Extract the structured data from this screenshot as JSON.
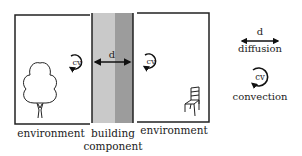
{
  "diagram": {
    "left_environment": {
      "label": "environment",
      "icon": "tree-icon",
      "convection_label": "cv"
    },
    "building_component": {
      "label_line1": "building",
      "label_line2": "component",
      "diffusion_label": "d",
      "colors": {
        "inner_layer": "#c9c9c9",
        "outer_layer": "#9c9c9c"
      }
    },
    "right_environment": {
      "label": "environment",
      "icon": "chair-icon",
      "convection_label": "cv"
    },
    "legend": {
      "diffusion": {
        "symbol": "d",
        "label": "diffusion"
      },
      "convection": {
        "symbol": "cv",
        "label": "convection"
      }
    }
  }
}
